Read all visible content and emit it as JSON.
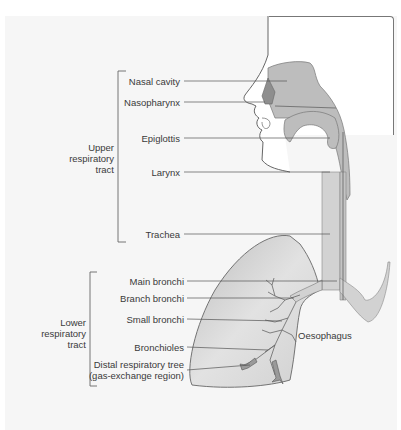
{
  "groups": {
    "upper": {
      "line1": "Upper",
      "line2": "respiratory",
      "line3": "tract"
    },
    "lower": {
      "line1": "Lower",
      "line2": "respiratory",
      "line3": "tract"
    }
  },
  "labels": {
    "nasal_cavity": "Nasal cavity",
    "nasopharynx": "Nasopharynx",
    "epiglottis": "Epiglottis",
    "larynx": "Larynx",
    "trachea": "Trachea",
    "main_bronchi": "Main bronchi",
    "branch_bronchi": "Branch bronchi",
    "small_bronchi": "Small bronchi",
    "bronchioles": "Bronchioles",
    "distal_line1": "Distal respiratory tree",
    "distal_line2": "(gas-exchange region)",
    "oesophagus": "Oesophagus"
  },
  "colors": {
    "tissue": "#c9c9c9",
    "tissue_dark": "#a9a9a9",
    "lung": "#dcdcdc",
    "line": "#555555"
  }
}
